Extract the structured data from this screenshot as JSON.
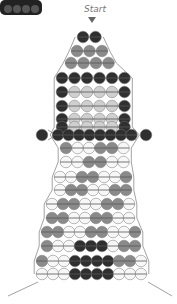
{
  "label": "Start",
  "colors": {
    "D": "#2f2f2f",
    "G": "#8a8a8a",
    "L": "#cfcfcf",
    "W": "#f7f7f7",
    "thread": "#8a8a8a"
  },
  "rows": [
    {
      "y": 37,
      "x0": 83,
      "pitch": 12.5,
      "beads": "DD"
    },
    {
      "y": 51,
      "x0": 77,
      "pitch": 12.5,
      "beads": "GGG"
    },
    {
      "y": 63,
      "x0": 71,
      "pitch": 12.5,
      "beads": "GGGG"
    },
    {
      "y": 78,
      "x0": 62,
      "pitch": 12.5,
      "beads": "DDDDDD"
    },
    {
      "y": 92,
      "x0": 62,
      "pitch": 12.5,
      "beads": "DLLLLD"
    },
    {
      "y": 106,
      "x0": 62,
      "pitch": 12.5,
      "beads": "DLLLLD"
    },
    {
      "y": 119,
      "x0": 62,
      "pitch": 12.5,
      "beads": "DLLLLD"
    },
    {
      "y": 127,
      "x0": 62,
      "pitch": 12.5,
      "beads": "DLLLLD"
    },
    {
      "y": 135,
      "x0": 58,
      "pitch": 10.5,
      "beads": "DDDDDDDD"
    },
    {
      "y": 148,
      "x0": 66,
      "pitch": 11.5,
      "beads": "GWWGGW"
    },
    {
      "y": 162,
      "x0": 66,
      "pitch": 11.5,
      "beads": "WWGGWW"
    },
    {
      "y": 177,
      "x0": 60,
      "pitch": 11,
      "beads": "WWGGWWG"
    },
    {
      "y": 190,
      "x0": 60,
      "pitch": 11,
      "beads": "WGGWWGG"
    },
    {
      "y": 204,
      "x0": 52,
      "pitch": 11,
      "beads": "WGGWWGGW"
    },
    {
      "y": 218,
      "x0": 52,
      "pitch": 11,
      "beads": "GGWWGGWW"
    },
    {
      "y": 232,
      "x0": 47,
      "pitch": 11,
      "beads": "GGWWGGWWG"
    },
    {
      "y": 246,
      "x0": 47,
      "pitch": 11,
      "beads": "GWWDDDWGG"
    },
    {
      "y": 261,
      "x0": 42,
      "pitch": 11,
      "beads": "GWWDDDDGGW"
    },
    {
      "y": 274,
      "x0": 42,
      "pitch": 11,
      "beads": "WWWDDDDWWW"
    }
  ],
  "arms": [
    {
      "x": 42,
      "y": 135,
      "color": "D"
    },
    {
      "x": 146,
      "y": 135,
      "color": "D"
    }
  ]
}
